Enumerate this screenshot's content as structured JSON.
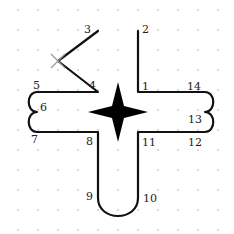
{
  "diagram": {
    "type": "sewing-pattern-path",
    "colors": {
      "line": "#111111",
      "grid": "#c8c8c8",
      "cross": "#9a9a9a",
      "star": "#000000",
      "background": "#ffffff"
    },
    "grid": {
      "spacing": 20,
      "x_start": 18,
      "y_start": 10
    },
    "points": [
      {
        "id": "1",
        "label": "1",
        "x": 138,
        "y": 92,
        "lx": 142,
        "ly": 90
      },
      {
        "id": "2",
        "label": "2",
        "x": 138,
        "y": 31,
        "lx": 142,
        "ly": 33
      },
      {
        "id": "3",
        "label": "3",
        "x": 98,
        "y": 31,
        "lx": 84,
        "ly": 33
      },
      {
        "id": "4",
        "label": "4",
        "x": 98,
        "y": 92,
        "lx": 89,
        "ly": 89
      },
      {
        "id": "5",
        "label": "5",
        "x": 37,
        "y": 92,
        "lx": 33,
        "ly": 89
      },
      {
        "id": "6",
        "label": "6",
        "x": 37,
        "y": 112,
        "lx": 40,
        "ly": 111
      },
      {
        "id": "7",
        "label": "7",
        "x": 37,
        "y": 132,
        "lx": 31,
        "ly": 143
      },
      {
        "id": "8",
        "label": "8",
        "x": 98,
        "y": 132,
        "lx": 86,
        "ly": 145
      },
      {
        "id": "9",
        "label": "9",
        "x": 98,
        "y": 198,
        "lx": 86,
        "ly": 200
      },
      {
        "id": "10",
        "label": "10",
        "x": 138,
        "y": 198,
        "lx": 143,
        "ly": 202
      },
      {
        "id": "11",
        "label": "11",
        "x": 138,
        "y": 132,
        "lx": 142,
        "ly": 146
      },
      {
        "id": "12",
        "label": "12",
        "x": 205,
        "y": 132,
        "lx": 188,
        "ly": 146
      },
      {
        "id": "13",
        "label": "13",
        "x": 205,
        "y": 112,
        "lx": 188,
        "ly": 123
      },
      {
        "id": "14",
        "label": "14",
        "x": 205,
        "y": 92,
        "lx": 187,
        "ly": 90
      }
    ],
    "cross_mark": {
      "x": 58,
      "y": 61,
      "size": 7
    },
    "star": {
      "cx": 118,
      "cy": 112,
      "arm": 30,
      "waist": 6
    }
  }
}
